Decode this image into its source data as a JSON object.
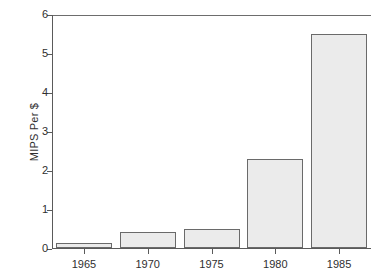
{
  "chart_data": {
    "type": "bar",
    "title": "",
    "xlabel": "",
    "ylabel": "MIPS Per $",
    "categories": [
      "1965",
      "1970",
      "1975",
      "1980",
      "1985"
    ],
    "values": [
      0.13,
      0.41,
      0.49,
      2.28,
      5.5
    ],
    "ylim": [
      0,
      6
    ],
    "yticks": [
      "0",
      "1",
      "2",
      "3",
      "4",
      "5",
      "6"
    ],
    "ytick_values": [
      0,
      1,
      2,
      3,
      4,
      5,
      6
    ],
    "grid": false,
    "legend": null,
    "series": [
      {
        "name": "MIPS Per $",
        "values": [
          0.13,
          0.41,
          0.49,
          2.28,
          5.5
        ]
      }
    ],
    "colors": {
      "bar_fill": "#ebebeb",
      "bar_stroke": "#6a6a6a",
      "axis": "#5a5a5a",
      "text": "#2f2f2f",
      "background": "#ffffff"
    }
  }
}
